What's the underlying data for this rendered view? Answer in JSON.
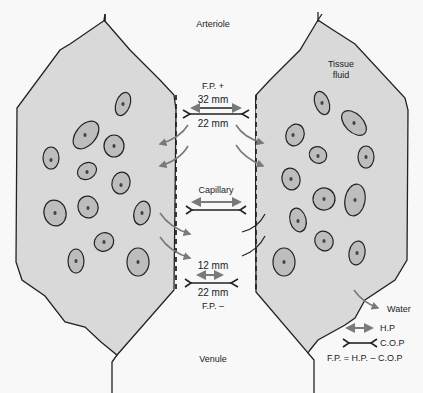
{
  "diagram": {
    "labels": {
      "arteriole": "Arteriole",
      "venule": "Venule",
      "capillary": "Capillary",
      "tissue_fluid_line1": "Tissue",
      "tissue_fluid_line2": "fluid",
      "arterial_fp": "F.P. +",
      "arterial_hp": "32 mm",
      "arterial_cop": "22 mm",
      "venous_hp": "12 mm",
      "venous_cop": "22 mm",
      "venous_fp": "F.P. –",
      "water": "Water"
    },
    "legend": {
      "hp_label": "H.P",
      "cop_label": "C.O.P",
      "formula": "F.P. = H.P. – C.O.P"
    },
    "colors": {
      "tissue_fill": "#d9d9d9",
      "cell_fill": "#bdbdbd",
      "outline": "#222222",
      "arrow_gray": "#7a7a7a",
      "background": "#f8f8f8"
    }
  }
}
